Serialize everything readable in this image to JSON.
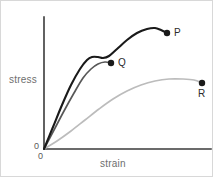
{
  "figure": {
    "background_color": "#ffffff",
    "border_color": "#d8d8d8",
    "width": 213,
    "height": 177
  },
  "axes": {
    "y_label": "stress",
    "x_label": "strain",
    "origin_label_left": "0",
    "origin_label_bottom": "0",
    "axis_color": "#3a3a3a",
    "label_color": "#6e6e6e",
    "y_axis": {
      "x": 43,
      "y_top": 16,
      "y_bottom": 148
    },
    "x_axis": {
      "y": 148,
      "x_left": 43,
      "x_right": 210
    }
  },
  "chart_data": {
    "type": "line",
    "title": "",
    "xlabel": "strain",
    "ylabel": "stress",
    "grid": false,
    "legend": "none",
    "axis_ticks": false,
    "xlim": [
      0,
      1
    ],
    "ylim": [
      0,
      1
    ],
    "series": [
      {
        "name": "P",
        "endpoint_label": "P",
        "color": "#1a1a1a",
        "stroke_width": 2.1,
        "label_position": "right",
        "points": [
          [
            43,
            148
          ],
          [
            52,
            126
          ],
          [
            61,
            104
          ],
          [
            70,
            84
          ],
          [
            79,
            68
          ],
          [
            86,
            59
          ],
          [
            91,
            56
          ],
          [
            97,
            56
          ],
          [
            102,
            57
          ],
          [
            108,
            55
          ],
          [
            116,
            48
          ],
          [
            126,
            39
          ],
          [
            136,
            32
          ],
          [
            146,
            28
          ],
          [
            154,
            27
          ],
          [
            160,
            29
          ],
          [
            166,
            32
          ]
        ],
        "end_point": [
          166,
          32
        ]
      },
      {
        "name": "Q",
        "endpoint_label": "Q",
        "color": "#585858",
        "stroke_width": 1.7,
        "label_position": "right",
        "points": [
          [
            43,
            148
          ],
          [
            53,
            129
          ],
          [
            63,
            110
          ],
          [
            73,
            92
          ],
          [
            82,
            77
          ],
          [
            90,
            68
          ],
          [
            97,
            63
          ],
          [
            104,
            61
          ],
          [
            110,
            62
          ]
        ],
        "end_point": [
          110,
          62
        ]
      },
      {
        "name": "R",
        "endpoint_label": "R",
        "color": "#bcbcbc",
        "stroke_width": 1.7,
        "label_position": "below",
        "points": [
          [
            43,
            148
          ],
          [
            56,
            140
          ],
          [
            70,
            130
          ],
          [
            84,
            119
          ],
          [
            98,
            108
          ],
          [
            112,
            98
          ],
          [
            126,
            90
          ],
          [
            140,
            84
          ],
          [
            154,
            80
          ],
          [
            168,
            78
          ],
          [
            182,
            78
          ],
          [
            193,
            79
          ],
          [
            201,
            82
          ]
        ],
        "end_point": [
          201,
          82
        ]
      }
    ],
    "point_markers": [
      {
        "label": "P",
        "x": 166,
        "y": 32,
        "radius": 3.2,
        "color": "#1a1a1a"
      },
      {
        "label": "Q",
        "x": 110,
        "y": 62,
        "radius": 3.2,
        "color": "#1a1a1a"
      },
      {
        "label": "R",
        "x": 201,
        "y": 82,
        "radius": 3.2,
        "color": "#1a1a1a"
      }
    ]
  }
}
